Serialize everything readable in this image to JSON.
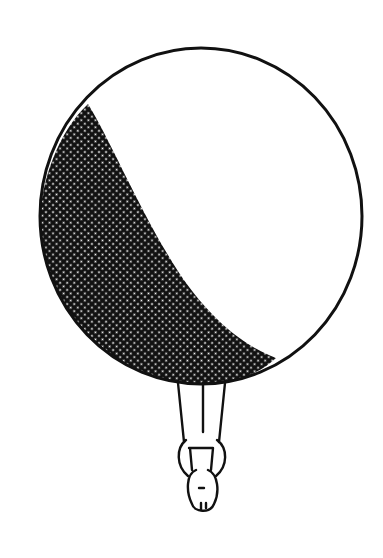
{
  "illustration": {
    "subject": "person hanging upside-down beneath a large sphere with a shaded crescent",
    "colors": {
      "ink": "#111111",
      "paper": "#ffffff",
      "halftone_dot": "#ffffff"
    },
    "sphere": {
      "cx": 201,
      "cy": 216,
      "rx": 161,
      "ry": 168
    },
    "figure": {
      "orientation": "upside-down",
      "position": "below sphere"
    }
  }
}
